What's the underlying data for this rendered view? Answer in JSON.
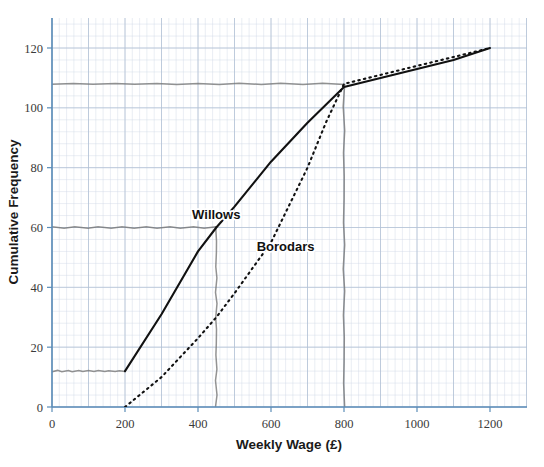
{
  "chart_data": {
    "type": "line",
    "title": "",
    "xlabel": "Weekly Wage (£)",
    "ylabel": "Cumulative Frequency",
    "xlim": [
      0,
      1300
    ],
    "ylim": [
      0,
      128
    ],
    "xticks": [
      "0",
      "200",
      "400",
      "600",
      "800",
      "1000",
      "1200"
    ],
    "xtick_values": [
      0,
      200,
      400,
      600,
      800,
      1000,
      1200
    ],
    "yticks": [
      "0",
      "20",
      "40",
      "60",
      "80",
      "100",
      "120"
    ],
    "ytick_values": [
      0,
      20,
      40,
      60,
      80,
      100,
      120
    ],
    "grid": "minor-and-major graph paper",
    "legend": "inline annotations",
    "series": [
      {
        "name": "Willows",
        "style": "solid",
        "color": "#111111",
        "x": [
          200,
          300,
          400,
          450,
          500,
          600,
          700,
          800,
          900,
          1000,
          1100,
          1200
        ],
        "y": [
          12,
          31,
          52,
          60,
          67,
          82,
          95,
          107,
          110,
          113,
          116,
          120
        ]
      },
      {
        "name": "Borodars",
        "style": "dotted",
        "color": "#111111",
        "x": [
          200,
          300,
          400,
          450,
          500,
          600,
          700,
          750,
          800,
          900,
          1000,
          1100,
          1200
        ],
        "y": [
          0,
          10,
          23,
          30,
          38,
          55,
          80,
          95,
          108,
          111,
          114,
          117,
          120
        ]
      }
    ],
    "annotations": [
      {
        "name": "willows-label",
        "text": "Willows",
        "x": 450,
        "y": 63
      },
      {
        "name": "borodars-label",
        "text": "Borodars",
        "x": 640,
        "y": 52
      }
    ],
    "pencil_guides": [
      {
        "name": "median-willows-horizontal",
        "from": [
          0,
          60
        ],
        "to": [
          450,
          60
        ]
      },
      {
        "name": "median-willows-vertical",
        "from": [
          450,
          60
        ],
        "to": [
          450,
          0
        ]
      },
      {
        "name": "lower-horizontal",
        "from": [
          0,
          12
        ],
        "to": [
          200,
          12
        ]
      },
      {
        "name": "upper-horizontal",
        "from": [
          0,
          108
        ],
        "to": [
          800,
          108
        ]
      },
      {
        "name": "upper-vertical",
        "from": [
          800,
          108
        ],
        "to": [
          800,
          0
        ]
      }
    ]
  },
  "colors": {
    "axis": "#5b8db8",
    "grid_minor": "#cfd8e6",
    "grid_major": "#b3c1d6",
    "curve": "#111111",
    "pencil": "#6f6f6f"
  }
}
